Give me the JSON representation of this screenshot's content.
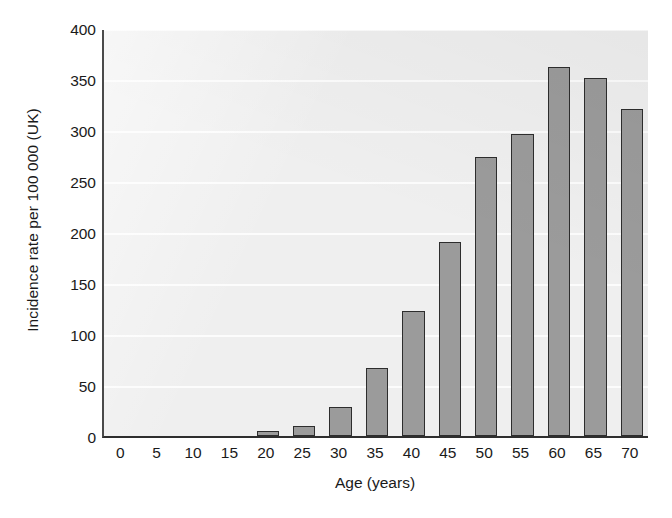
{
  "chart_data": {
    "type": "bar",
    "title": "",
    "xlabel": "Age (years)",
    "ylabel": "Incidence rate per 100 000 (UK)",
    "categories": [
      "0",
      "5",
      "10",
      "15",
      "20",
      "25",
      "30",
      "35",
      "40",
      "45",
      "50",
      "55",
      "60",
      "65",
      "70"
    ],
    "values": [
      0,
      0,
      0,
      0,
      5,
      10,
      28,
      67,
      123,
      190,
      274,
      296,
      362,
      351,
      321
    ],
    "xlim": [
      -2.5,
      72.5
    ],
    "ylim": [
      0,
      400
    ],
    "ytick_labels": [
      "0",
      "50",
      "100",
      "150",
      "200",
      "250",
      "300",
      "350",
      "400"
    ],
    "ytick_values": [
      0,
      50,
      100,
      150,
      200,
      250,
      300,
      350,
      400
    ],
    "xtick_labels": [
      "0",
      "5",
      "10",
      "15",
      "20",
      "25",
      "30",
      "35",
      "40",
      "45",
      "50",
      "55",
      "60",
      "65",
      "70"
    ],
    "grid": "horizontal",
    "legend": "none",
    "bar_color": "#9b9b9b",
    "bar_edge_color": "#2d2d2d",
    "plot_background": "#efefef",
    "gridline_color": "#fcfcfc",
    "axis_color": "#2e2e2e"
  },
  "axes": {
    "y_title": "Incidence rate per 100 000 (UK)",
    "x_title": "Age (years)"
  }
}
